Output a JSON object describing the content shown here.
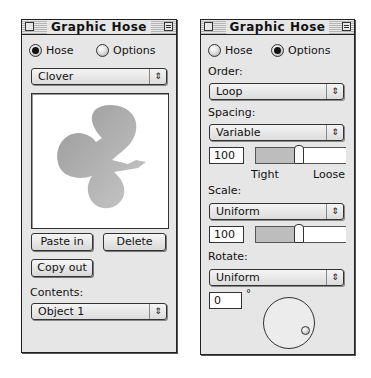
{
  "left_panel": {
    "title": "Graphic Hose",
    "mode_radios": [
      {
        "label": "Hose",
        "selected": true
      },
      {
        "label": "Options",
        "selected": false
      }
    ],
    "hose_select": {
      "value": "Clover"
    },
    "preview": {
      "content": "clover-shape-graphic"
    },
    "buttons": {
      "paste_in": "Paste in",
      "delete": "Delete",
      "copy_out": "Copy out"
    },
    "contents_label": "Contents:",
    "contents_select": {
      "value": "Object 1"
    }
  },
  "right_panel": {
    "title": "Graphic Hose",
    "mode_radios": [
      {
        "label": "Hose",
        "selected": false
      },
      {
        "label": "Options",
        "selected": true
      }
    ],
    "order": {
      "label": "Order:",
      "value": "Loop"
    },
    "spacing": {
      "label": "Spacing:",
      "value": "Variable",
      "amount": "100",
      "slider_percent": 38,
      "min_label": "Tight",
      "max_label": "Loose"
    },
    "scale": {
      "label": "Scale:",
      "value": "Uniform",
      "amount": "100",
      "slider_percent": 38
    },
    "rotate": {
      "label": "Rotate:",
      "value": "Uniform",
      "angle": "0",
      "degree_symbol": "°"
    }
  },
  "icons": {
    "popup_arrows": "⇕"
  }
}
